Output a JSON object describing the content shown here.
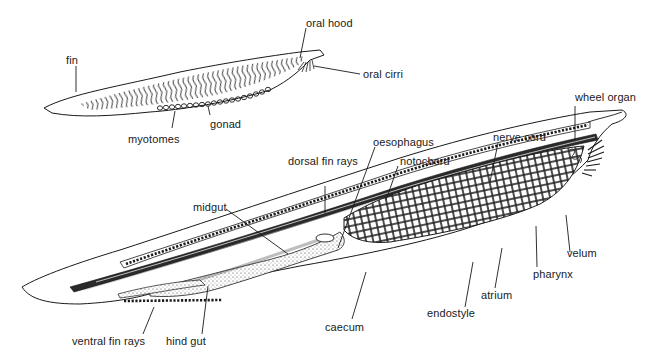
{
  "diagram": {
    "small_figure": {
      "labels": {
        "fin": "fin",
        "oral_hood": "oral hood",
        "oral_cirri": "oral cirri",
        "myotomes": "myotomes",
        "gonad": "gonad"
      }
    },
    "large_figure": {
      "labels": {
        "wheel_organ": "wheel organ",
        "nerve_cord": "nerve cord",
        "oesophagus": "oesophagus",
        "notochord": "notochord",
        "dorsal_fin_rays": "dorsal fin rays",
        "midgut": "midgut",
        "velum": "velum",
        "pharynx": "pharynx",
        "atrium": "atrium",
        "endostyle": "endostyle",
        "caecum": "caecum",
        "ventral_fin_rays": "ventral fin rays",
        "hind_gut": "hind gut"
      }
    },
    "colors": {
      "ink": "#1a1a1a",
      "background": "#ffffff"
    }
  }
}
